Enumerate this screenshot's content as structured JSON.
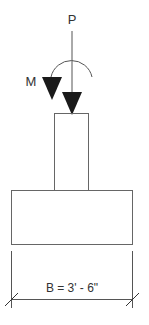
{
  "diagram": {
    "type": "footing-load-diagram",
    "labels": {
      "axial_load": "P",
      "moment": "M",
      "width_dimension": "B = 3' - 6\""
    },
    "colors": {
      "line": "#555555",
      "fill": "#1a1a1a",
      "text": "#333333",
      "background": "#ffffff"
    }
  }
}
